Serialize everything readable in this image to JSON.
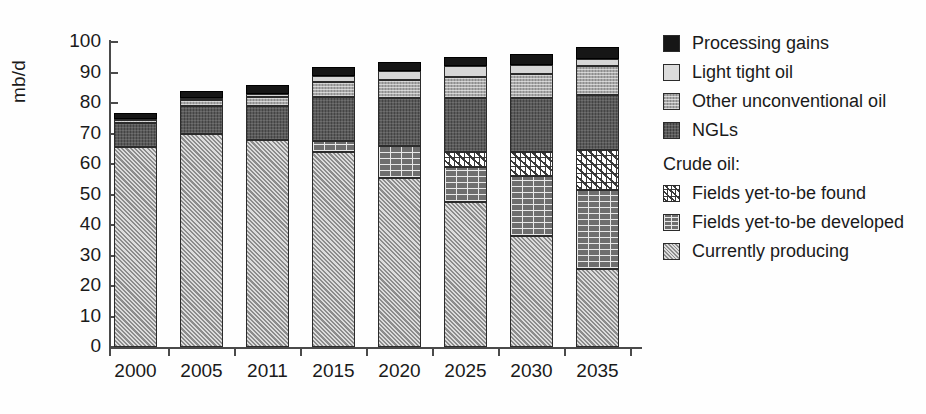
{
  "chart_data": {
    "type": "bar",
    "subtype": "stacked",
    "title": "",
    "xlabel": "",
    "ylabel": "mb/d",
    "ylim": [
      0,
      100
    ],
    "yticks": [
      0,
      10,
      20,
      30,
      40,
      50,
      60,
      70,
      80,
      90,
      100
    ],
    "grid": false,
    "legend_position": "right",
    "categories": [
      "2000",
      "2005",
      "2011",
      "2015",
      "2020",
      "2025",
      "2030",
      "2035"
    ],
    "series": [
      {
        "name": "Currently producing",
        "group": "Crude oil",
        "pattern": "diagonal-hatch",
        "color": "#b4b4b4",
        "values": [
          65.5,
          70.0,
          68.0,
          64.0,
          55.5,
          47.5,
          36.5,
          25.5
        ]
      },
      {
        "name": "Fields yet-to-be developed",
        "group": "Crude oil",
        "pattern": "brick",
        "color": "#6e6e6e",
        "values": [
          0,
          0,
          0,
          3.5,
          10.5,
          11.5,
          19.5,
          26.0
        ]
      },
      {
        "name": "Fields yet-to-be found",
        "group": "Crude oil",
        "pattern": "white-crosshatch",
        "color": "#ffffff",
        "values": [
          0,
          0,
          0,
          0,
          0,
          5.0,
          8.0,
          13.0
        ]
      },
      {
        "name": "NGLs",
        "group": "",
        "pattern": "dark-solid",
        "color": "#5a5a5a",
        "values": [
          8.0,
          9.0,
          11.0,
          14.5,
          15.5,
          17.5,
          17.5,
          18.0
        ]
      },
      {
        "name": "Other unconventional oil",
        "group": "",
        "pattern": "fine-grid",
        "color": "#a8a8a8",
        "values": [
          1.0,
          2.0,
          3.0,
          5.0,
          6.0,
          7.0,
          8.0,
          9.5
        ]
      },
      {
        "name": "Light tight oil",
        "group": "",
        "pattern": "light-solid",
        "color": "#d6d6d6",
        "values": [
          0.3,
          0.5,
          1.0,
          2.0,
          3.0,
          3.5,
          3.0,
          2.5
        ]
      },
      {
        "name": "Processing gains",
        "group": "",
        "pattern": "black",
        "color": "#161616",
        "values": [
          2.0,
          2.3,
          2.8,
          2.8,
          3.0,
          3.2,
          3.5,
          4.0
        ]
      }
    ],
    "totals": [
      76.8,
      83.8,
      85.8,
      91.8,
      93.5,
      95.2,
      96.0,
      98.5
    ]
  },
  "axis": {
    "y_title": "mb/d",
    "y_tick_labels": [
      "100",
      "90",
      "80",
      "70",
      "60",
      "50",
      "40",
      "30",
      "20",
      "10",
      "0"
    ],
    "x_tick_labels": [
      "2000",
      "2005",
      "2011",
      "2015",
      "2020",
      "2025",
      "2030",
      "2035"
    ]
  },
  "legend": {
    "top_items": [
      {
        "label": "Processing gains",
        "swatch": "s-black"
      },
      {
        "label": "Light tight oil",
        "swatch": "s-light"
      },
      {
        "label": "Other unconventional oil",
        "swatch": "s-med"
      },
      {
        "label": "NGLs",
        "swatch": "s-ngl"
      }
    ],
    "group_title": "Crude oil:",
    "group_items": [
      {
        "label": "Fields yet-to-be found",
        "swatch": "s-found"
      },
      {
        "label": "Fields yet-to-be developed",
        "swatch": "s-dev"
      },
      {
        "label": "Currently producing",
        "swatch": "s-prod"
      }
    ]
  }
}
